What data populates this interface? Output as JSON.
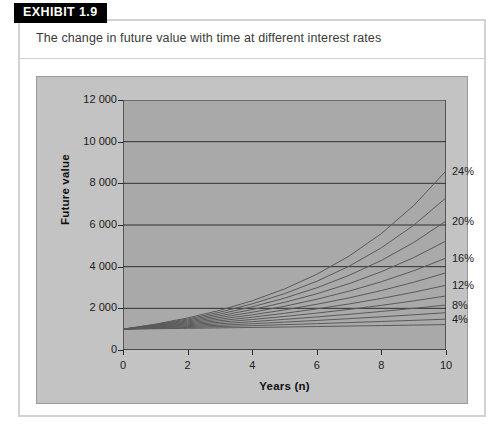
{
  "exhibit": {
    "tag": "EXHIBIT 1.9",
    "caption": "The change in future value with time at different interest rates"
  },
  "colors": {
    "panel_background": "#ffffff",
    "panel_border": "#d2d2d2",
    "chart_background": "#c3c3c3",
    "plot_background": "#a9a9a9",
    "gridline": "#2f2f2f",
    "curve": "#5a5a5a",
    "axis": "#2a2a2a",
    "text": "#1c1c1c",
    "tag_background": "#000000",
    "tag_text": "#ffffff"
  },
  "chart_data": {
    "type": "line",
    "title": "The change in future value with time at different interest rates",
    "xlabel": "Years (n)",
    "ylabel": "Future value",
    "xlim": [
      0,
      10
    ],
    "ylim": [
      0,
      12000
    ],
    "grid": true,
    "legend_position": "right-of-plot",
    "x_ticks": [
      "0",
      "2",
      "4",
      "6",
      "8",
      "10"
    ],
    "x_tick_values": [
      0,
      2,
      4,
      6,
      8,
      10
    ],
    "y_ticks": [
      "0",
      "2 000",
      "4 000",
      "6 000",
      "8 000",
      "10 000",
      "12 000"
    ],
    "y_tick_values": [
      0,
      2000,
      4000,
      6000,
      8000,
      10000,
      12000
    ],
    "x": [
      0,
      1,
      2,
      3,
      4,
      5,
      6,
      7,
      8,
      9,
      10
    ],
    "present_value": 1000,
    "labelled_rates": [
      "4%",
      "8%",
      "12%",
      "16%",
      "20%",
      "24%"
    ],
    "series": [
      {
        "name": "2%",
        "rate": 0.02,
        "labelled": false,
        "values": [
          1000,
          1020,
          1040,
          1061,
          1082,
          1104,
          1126,
          1149,
          1172,
          1195,
          1219
        ]
      },
      {
        "name": "4%",
        "rate": 0.04,
        "labelled": true,
        "values": [
          1000,
          1040,
          1082,
          1125,
          1170,
          1217,
          1265,
          1316,
          1369,
          1423,
          1480
        ]
      },
      {
        "name": "6%",
        "rate": 0.06,
        "labelled": false,
        "values": [
          1000,
          1060,
          1124,
          1191,
          1262,
          1338,
          1419,
          1504,
          1594,
          1689,
          1791
        ]
      },
      {
        "name": "8%",
        "rate": 0.08,
        "labelled": true,
        "values": [
          1000,
          1080,
          1166,
          1260,
          1360,
          1469,
          1587,
          1714,
          1851,
          1999,
          2159
        ]
      },
      {
        "name": "10%",
        "rate": 0.1,
        "labelled": false,
        "values": [
          1000,
          1100,
          1210,
          1331,
          1464,
          1611,
          1772,
          1949,
          2144,
          2358,
          2594
        ]
      },
      {
        "name": "12%",
        "rate": 0.12,
        "labelled": true,
        "values": [
          1000,
          1120,
          1254,
          1405,
          1574,
          1762,
          1974,
          2211,
          2476,
          2773,
          3106
        ]
      },
      {
        "name": "14%",
        "rate": 0.14,
        "labelled": false,
        "values": [
          1000,
          1140,
          1300,
          1482,
          1689,
          1925,
          2195,
          2502,
          2853,
          3252,
          3707
        ]
      },
      {
        "name": "16%",
        "rate": 0.16,
        "labelled": true,
        "values": [
          1000,
          1160,
          1346,
          1561,
          1811,
          2100,
          2436,
          2826,
          3278,
          3803,
          4411
        ]
      },
      {
        "name": "18%",
        "rate": 0.18,
        "labelled": false,
        "values": [
          1000,
          1180,
          1392,
          1643,
          1939,
          2288,
          2700,
          3185,
          3759,
          4435,
          5234
        ]
      },
      {
        "name": "20%",
        "rate": 0.2,
        "labelled": true,
        "values": [
          1000,
          1200,
          1440,
          1728,
          2074,
          2488,
          2986,
          3583,
          4300,
          5160,
          6192
        ]
      },
      {
        "name": "22%",
        "rate": 0.22,
        "labelled": false,
        "values": [
          1000,
          1220,
          1488,
          1816,
          2215,
          2703,
          3297,
          4023,
          4908,
          5987,
          7305
        ]
      },
      {
        "name": "24%",
        "rate": 0.24,
        "labelled": true,
        "values": [
          1000,
          1240,
          1538,
          1907,
          2364,
          2932,
          3635,
          4508,
          5590,
          6931,
          8594
        ]
      }
    ]
  }
}
